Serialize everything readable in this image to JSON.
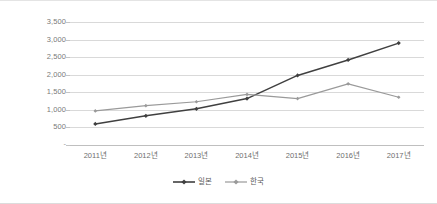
{
  "chart_data": {
    "type": "line",
    "title": "",
    "subtitle": "",
    "xlabel": "",
    "ylabel": "",
    "categories": [
      "2011년",
      "2012년",
      "2013년",
      "2014년",
      "2015년",
      "2016년",
      "2017년"
    ],
    "series": [
      {
        "name": "일본",
        "color": "#404040",
        "marker": "diamond",
        "values": [
          600,
          830,
          1030,
          1320,
          1980,
          2420,
          2900
        ]
      },
      {
        "name": "한국",
        "color": "#9a9a9a",
        "marker": "diamond",
        "values": [
          970,
          1120,
          1230,
          1440,
          1320,
          1740,
          1360
        ]
      }
    ],
    "ylim": [
      0,
      3500
    ],
    "ytick_values": [
      3500,
      3000,
      2500,
      2000,
      1500,
      1000,
      500
    ],
    "ytick_labels": [
      "3,500",
      "3,000",
      "2,500",
      "2,000",
      "1,500",
      "1,000",
      "500"
    ],
    "y_zero_label": "-",
    "grid": true,
    "grid_axis": "y",
    "grid_color": "#d9d9d9",
    "legend_position": "bottom",
    "plot_background": "#ffffff",
    "border_color": "#e0e0e0"
  }
}
